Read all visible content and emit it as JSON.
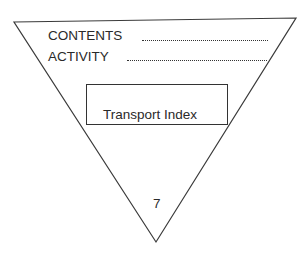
{
  "label": {
    "contents_label": "CONTENTS",
    "activity_label": "ACTIVITY",
    "transport_index_label": "Transport Index",
    "category_number": "7"
  },
  "colors": {
    "line": "#333333",
    "background": "#ffffff"
  }
}
